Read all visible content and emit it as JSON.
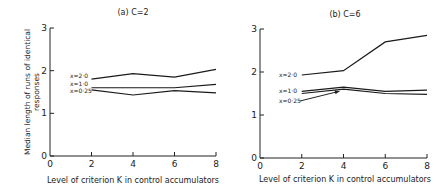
{
  "chart_data": [
    {
      "type": "line",
      "title": "(a) C=2",
      "xlabel": "Level of criterion K in control accumulators",
      "ylabel": "Median length of runs of identical responses",
      "x": [
        2,
        4,
        6,
        8
      ],
      "xticks": [
        0,
        2,
        4,
        6,
        8
      ],
      "yticks": [
        0,
        1,
        2,
        3
      ],
      "xlim": [
        0,
        8
      ],
      "ylim": [
        0,
        3
      ],
      "grid": false,
      "series": [
        {
          "name": "x=2·0",
          "values": [
            1.8,
            1.93,
            1.85,
            2.03
          ]
        },
        {
          "name": "x=1·0",
          "values": [
            1.6,
            1.6,
            1.6,
            1.68
          ]
        },
        {
          "name": "x=0·25",
          "values": [
            1.55,
            1.43,
            1.53,
            1.48
          ]
        }
      ]
    },
    {
      "type": "line",
      "title": "(b) C=6",
      "xlabel": "Level of criterion K in control accumulators",
      "ylabel": "",
      "x": [
        2,
        4,
        6,
        8
      ],
      "xticks": [
        0,
        2,
        4,
        6,
        8
      ],
      "yticks": [
        0,
        1,
        2,
        3
      ],
      "xlim": [
        0,
        8
      ],
      "ylim": [
        0,
        3
      ],
      "grid": false,
      "series": [
        {
          "name": "x=2·0",
          "values": [
            1.93,
            2.03,
            2.7,
            2.85
          ]
        },
        {
          "name": "x=1·0",
          "values": [
            1.55,
            1.65,
            1.55,
            1.58
          ]
        },
        {
          "name": "x=0·25",
          "values": [
            1.5,
            1.6,
            1.5,
            1.48
          ]
        }
      ]
    }
  ],
  "panels": [
    {
      "title": "(a) C=2",
      "xlabel": "Level of criterion K in control accumulators",
      "ylabel_line1": "Median length of runs of identical",
      "ylabel_line2": "responses",
      "xtick_labels": [
        "0",
        "2",
        "4",
        "6",
        "8"
      ],
      "ytick_labels": [
        "0",
        "1",
        "2",
        "3"
      ],
      "series_labels": [
        "x=2·0",
        "x=1·0",
        "x=0·25"
      ]
    },
    {
      "title": "(b) C=6",
      "xlabel": "Level of criterion K in control accumulators",
      "xtick_labels": [
        "0",
        "2",
        "4",
        "6",
        "8"
      ],
      "ytick_labels": [
        "0",
        "1",
        "2",
        "3"
      ],
      "series_labels": [
        "x=2·0",
        "x=1·0",
        "x=0·25"
      ]
    }
  ]
}
